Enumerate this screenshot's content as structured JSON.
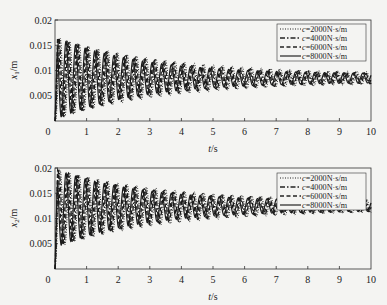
{
  "chart_data": [
    {
      "type": "line",
      "title": "",
      "xlabel": "t/s",
      "ylabel": "x1/m",
      "xlim": [
        0,
        10
      ],
      "ylim": [
        0,
        0.02
      ],
      "xticks": [
        "0",
        "1",
        "2",
        "3",
        "4",
        "5",
        "6",
        "7",
        "8",
        "9",
        "10"
      ],
      "yticks": [
        "0.005",
        "0.01",
        "0.015",
        "0.02"
      ],
      "y_origin_label": "0",
      "grid": false,
      "legend_position": "upper right",
      "oscillation": {
        "frequency_hz": 3.3,
        "mean_start": 0.0085,
        "amp_start": 0.0082,
        "amp_end": 0.0008,
        "mean_end": 0.0085,
        "decay": 0.28
      },
      "series": [
        {
          "name": "c=2000N·s/m",
          "style": "dotted"
        },
        {
          "name": "c=4000N·s/m",
          "style": "dashdot"
        },
        {
          "name": "c=6000N·s/m",
          "style": "dashed"
        },
        {
          "name": "c=8000N·s/m",
          "style": "solid"
        }
      ]
    },
    {
      "type": "line",
      "title": "",
      "xlabel": "t/s",
      "ylabel": "x2/m",
      "xlim": [
        0,
        10
      ],
      "ylim": [
        0,
        0.02
      ],
      "xticks": [
        "0",
        "1",
        "2",
        "3",
        "4",
        "5",
        "6",
        "7",
        "8",
        "9",
        "10"
      ],
      "yticks": [
        "0.005",
        "0.01",
        "0.015",
        "0.02"
      ],
      "y_origin_label": "0",
      "grid": false,
      "legend_position": "upper right",
      "oscillation": {
        "frequency_hz": 3.3,
        "mean_start": 0.012,
        "amp_start": 0.0078,
        "amp_end": 0.0009,
        "mean_end": 0.0125,
        "decay": 0.28
      },
      "series": [
        {
          "name": "c=2000N·s/m",
          "style": "dotted"
        },
        {
          "name": "c=4000N·s/m",
          "style": "dashdot"
        },
        {
          "name": "c=6000N·s/m",
          "style": "dashed"
        },
        {
          "name": "c=8000N·s/m",
          "style": "solid"
        }
      ]
    }
  ],
  "plots": [
    {
      "ylabel_var": "x",
      "ylabel_sub": "1",
      "ylabel_unit": "/m",
      "xlabel_var": "t",
      "xlabel_unit": "/s",
      "legend": [
        {
          "var": "c",
          "text": "=2000N·s/m"
        },
        {
          "var": "c",
          "text": "=4000N·s/m"
        },
        {
          "var": "c",
          "text": "=6000N·s/m"
        },
        {
          "var": "c",
          "text": "=8000N·s/m"
        }
      ]
    },
    {
      "ylabel_var": "x",
      "ylabel_sub": "2",
      "ylabel_unit": "/m",
      "xlabel_var": "t",
      "xlabel_unit": "/s",
      "legend": [
        {
          "var": "c",
          "text": "=2000N·s/m"
        },
        {
          "var": "c",
          "text": "=4000N·s/m"
        },
        {
          "var": "c",
          "text": "=6000N·s/m"
        },
        {
          "var": "c",
          "text": "=8000N·s/m"
        }
      ]
    }
  ]
}
